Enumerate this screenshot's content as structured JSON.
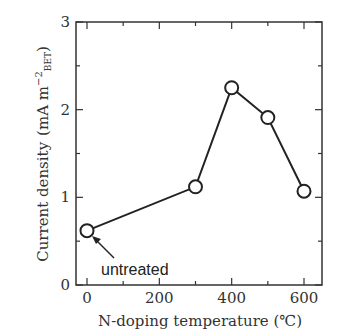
{
  "chart_data": {
    "type": "line",
    "title": "",
    "xlabel": "N-doping temperature (℃)",
    "ylabel": "Current density (mA m⁻²BET)",
    "ylabel_main": "Current density",
    "ylabel_unit": "(mA m",
    "ylabel_sup": "−2",
    "ylabel_sub": "BET",
    "ylabel_close": ")",
    "xlim": [
      -20,
      650
    ],
    "ylim": [
      0,
      3
    ],
    "x_ticks": [
      0,
      200,
      400,
      600
    ],
    "y_ticks": [
      0,
      1,
      2,
      3
    ],
    "grid": false,
    "legend": null,
    "series": [
      {
        "name": "Current density",
        "marker": "open-circle",
        "x": [
          0,
          300,
          400,
          500,
          600
        ],
        "values": [
          0.62,
          1.12,
          2.25,
          1.91,
          1.07
        ]
      }
    ],
    "annotations": [
      {
        "text": "untreated",
        "points_to": {
          "x": 0,
          "y": 0.62
        }
      }
    ]
  }
}
